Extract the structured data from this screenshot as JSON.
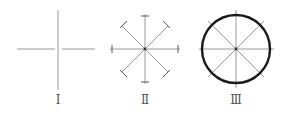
{
  "figures": [
    {
      "id": "I",
      "label": "Ⅰ",
      "description": "cross of two perpendicular lines"
    },
    {
      "id": "II",
      "label": "Ⅱ",
      "description": "eight rays with tick marks at ends"
    },
    {
      "id": "III",
      "label": "Ⅲ",
      "description": "circle drawn through the ray ends"
    }
  ],
  "colors": {
    "guide_line": "#9a9a9a",
    "circle": "#1a1a1a",
    "label": "#555555"
  }
}
